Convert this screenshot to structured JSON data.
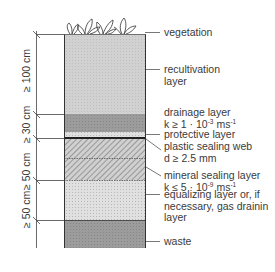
{
  "diagram": {
    "colors": {
      "recultivation": "#c9c9c9",
      "drainage": "#8a8a8a",
      "protective": "#d6d6d6",
      "sealing_web": "#222222",
      "mineral_sealing_hatch": "#9a9a9a",
      "equalizing": "#d9d9d9",
      "waste": "#979797",
      "line": "#444444"
    },
    "layers": [
      {
        "id": "vegetation",
        "label_lines": [
          "vegetation"
        ]
      },
      {
        "id": "recultivation",
        "label_lines": [
          "recultivation",
          "layer"
        ]
      },
      {
        "id": "drainage",
        "label_lines": [
          "drainage layer"
        ],
        "param": {
          "prefix": "k ≥ 1 · 10",
          "exp": "-3",
          "unit": " ms",
          "unit_exp": "-1"
        }
      },
      {
        "id": "protective",
        "label_lines": [
          "protective layer"
        ]
      },
      {
        "id": "sealing-web",
        "label_lines": [
          "plastic sealing web",
          "d ≥ 2.5 mm"
        ]
      },
      {
        "id": "mineral-sealing",
        "label_lines": [
          "mineral sealing layer"
        ],
        "param": {
          "prefix": "k ≤  5 · 10",
          "exp": "-9",
          "unit": " ms",
          "unit_exp": "-1"
        }
      },
      {
        "id": "equalizing",
        "label_lines": [
          "equalizing layer or, if",
          "necessary, gas drainin",
          "layer"
        ]
      },
      {
        "id": "waste",
        "label_lines": [
          "waste"
        ]
      }
    ],
    "dimensions": [
      {
        "label": "≥ 100 cm"
      },
      {
        "label": "≥ 30 cm"
      },
      {
        "label": "≥ 50 cm"
      },
      {
        "label": "≥ 50 cm"
      }
    ]
  }
}
